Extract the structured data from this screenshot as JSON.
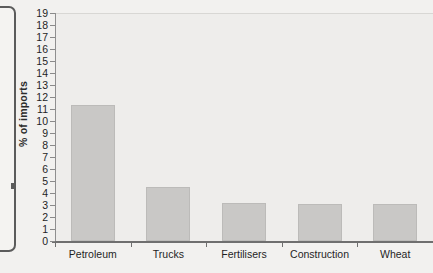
{
  "chart_data": {
    "type": "bar",
    "title": "",
    "subtitle": "",
    "xlabel": "",
    "ylabel": "% of imports",
    "categories": [
      "Petroleum",
      "Trucks",
      "Fertilisers",
      "Construction",
      "Wheat"
    ],
    "values": [
      11.3,
      4.5,
      3.2,
      3.1,
      3.1
    ],
    "series": [
      {
        "name": "% of imports",
        "values": [
          11.3,
          4.5,
          3.2,
          3.1,
          3.1
        ]
      }
    ],
    "ylim": [
      0,
      19
    ],
    "ytick_step": 1,
    "ytick_labels": [
      "0",
      "1",
      "2",
      "3",
      "4",
      "5",
      "6",
      "7",
      "8",
      "9",
      "10",
      "11",
      "12",
      "13",
      "14",
      "15",
      "16",
      "17",
      "18",
      "19"
    ],
    "grid": false,
    "legend": false,
    "legend_position": "none",
    "bar_color": "#c9c8c6",
    "plot_background": "#eeedeb",
    "page_background": "#f2f1ef",
    "axis_color": "#6f6f6f",
    "text_color": "#1f1f1f"
  }
}
